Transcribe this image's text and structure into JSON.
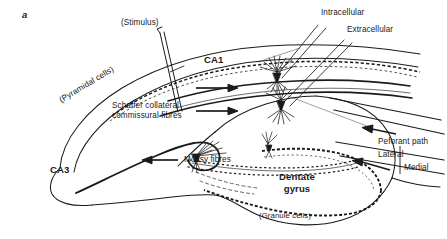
{
  "figure": {
    "panel_letter": "a",
    "type": "hippocampal-circuit-diagram",
    "ink_color": "#1a1a1a",
    "background_color": "#ffffff"
  },
  "labels": {
    "stimulus": "(Stimulus)",
    "intracellular": "Intracellular",
    "extracellular": "Extracellular",
    "ca1": "CA1",
    "ca3": "CA3",
    "pyramidal_cells": "(Pyramidal cells)",
    "schaffer_line1": "Schaffer collateral",
    "schaffer_line2": "commissural fibres",
    "mossy_fibres": "Mossy fibres",
    "dentate_line1": "Dentate",
    "dentate_line2": "gyrus",
    "granule_cells": "(Granule cells)",
    "perforant_path": "Peforant path",
    "lateral": "Lateral",
    "medial": "Medial"
  },
  "icons": {
    "stimulus_electrode": "stimulating-electrode-icon",
    "intracellular_electrode": "intracellular-electrode-icon",
    "extracellular_electrode": "extracellular-electrode-icon",
    "arrow_schaffer_upper": "arrow-right-icon",
    "arrow_schaffer_lower": "arrow-right-icon",
    "arrow_mossy": "arrow-left-icon",
    "arrow_perforant_lateral": "arrow-left-icon",
    "arrow_perforant_medial": "arrow-left-icon",
    "bracket_perforant": "brace-icon"
  }
}
